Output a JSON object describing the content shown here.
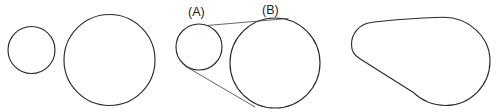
{
  "figure": {
    "type": "geometric-diagram",
    "title": "",
    "background_color": "#ffffff",
    "stroke_color": "#2b2b2b",
    "tangent_color": "#4a4a4a",
    "width": 500,
    "height": 112,
    "panels": [
      {
        "name": "separate-circles",
        "description": "Two unconnected circles of different radii",
        "shapes": [
          {
            "kind": "circle",
            "cx": 31.5,
            "cy": 50.0,
            "r": 23.5
          },
          {
            "kind": "circle",
            "cx": 109.5,
            "cy": 60.0,
            "r": 45.5
          }
        ]
      },
      {
        "name": "tangent-construction",
        "description": "Same two circles joined by external tangent lines, circles labelled (A) and (B)",
        "shapes": [
          {
            "kind": "circle",
            "cx": 199.0,
            "cy": 47.0,
            "r": 23.0
          },
          {
            "kind": "circle",
            "cx": 275.0,
            "cy": 63.0,
            "r": 45.0
          }
        ],
        "tangents": [
          {
            "kind": "line",
            "x1": 207.0,
            "y1": 25.5,
            "x2": 288.0,
            "y2": 18.5
          },
          {
            "kind": "line",
            "x1": 185.0,
            "y1": 66.0,
            "x2": 255.0,
            "y2": 107.0
          }
        ],
        "labels": [
          {
            "text": "(A)",
            "x": 188.0,
            "y": 16.0
          },
          {
            "text": "(B)",
            "x": 262.0,
            "y": 14.0
          }
        ]
      },
      {
        "name": "belt-hull",
        "description": "Resulting convex hull (belt) outline wrapping both circles",
        "shapes": [
          {
            "kind": "hull",
            "small_circle": {
              "cx": 373.0,
              "cy": 44.0,
              "r": 21.5
            },
            "large_circle": {
              "cx": 446.0,
              "cy": 61.0,
              "r": 44.0
            }
          }
        ]
      }
    ],
    "labels_list": [
      "(A)",
      "(B)"
    ]
  }
}
